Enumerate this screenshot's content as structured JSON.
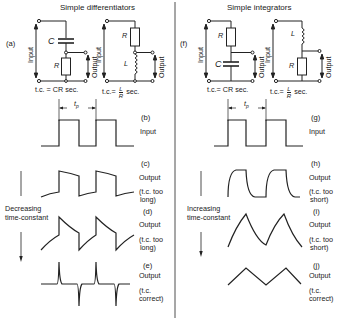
{
  "left": {
    "title": "Simple differentiators",
    "circuit_label": "(a)",
    "input_label": "Input",
    "output_label": "Output",
    "c_label": "C",
    "r_label": "R",
    "l_label": "L",
    "tc_cr": "t.c. = CR sec.",
    "tc_lr_prefix": "t.c.=",
    "tc_lr_num": "L",
    "tc_lr_den": "R",
    "tc_lr_suffix": "sec.",
    "period_label": "tp",
    "arrow_label": "Decreasing\ntime-constant",
    "arrow_line1": "Decreasing",
    "arrow_line2": "time-constant",
    "waves": [
      {
        "id": "(b)",
        "name": "Input",
        "note1": "",
        "note2": ""
      },
      {
        "id": "(c)",
        "name": "Output",
        "note1": "(t.c. too",
        "note2": "long)"
      },
      {
        "id": "(d)",
        "name": "Output",
        "note1": "(t.c. too",
        "note2": "long)"
      },
      {
        "id": "(e)",
        "name": "Output",
        "note1": "(t.c.",
        "note2": "correct)"
      }
    ]
  },
  "right": {
    "title": "Simple integrators",
    "circuit_label": "(f)",
    "input_label": "Input",
    "output_label": "Output",
    "c_label": "C",
    "r_label": "R",
    "l_label": "L",
    "tc_cr": "t.c.= CR sec.",
    "tc_lr_prefix": "t.c.=",
    "tc_lr_num": "L",
    "tc_lr_den": "R",
    "tc_lr_suffix": "sec.",
    "period_label": "tp",
    "arrow_line1": "Increasing",
    "arrow_line2": "time-constant",
    "waves": [
      {
        "id": "(g)",
        "name": "Input",
        "note1": "",
        "note2": ""
      },
      {
        "id": "(h)",
        "name": "Output",
        "note1": "(t.c. too",
        "note2": "short)"
      },
      {
        "id": "(i)",
        "name": "Output",
        "note1": "(t.c. too",
        "note2": "short)"
      },
      {
        "id": "(j)",
        "name": "Output",
        "note1": "(t.c.",
        "note2": "correct)"
      }
    ]
  }
}
